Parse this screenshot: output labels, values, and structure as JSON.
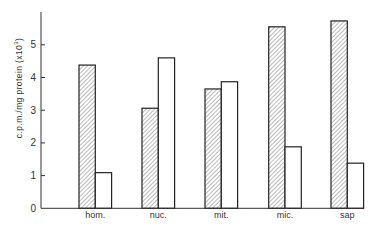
{
  "chart_data": {
    "type": "bar",
    "title": "",
    "xlabel": "",
    "ylabel": "c.p.m./mg protein (x10",
    "ylabel_superscript": "3",
    "ylabel_suffix": ")",
    "categories": [
      "hom.",
      "nuc.",
      "mit.",
      "mic.",
      "sap"
    ],
    "series": [
      {
        "name": "hatched",
        "pattern": "diagonal-hatch",
        "values": [
          4.38,
          3.06,
          3.65,
          5.55,
          5.73
        ]
      },
      {
        "name": "open",
        "pattern": "none",
        "values": [
          1.09,
          4.6,
          3.87,
          1.88,
          1.38
        ]
      }
    ],
    "yticks": [
      "0",
      "1",
      "2",
      "3",
      "4",
      "5"
    ],
    "ylim": [
      0,
      5.9
    ],
    "grid": false,
    "legend": "none",
    "colors": {
      "stroke": "#222222",
      "hatch": "#777777",
      "fill_open": "#ffffff"
    }
  }
}
